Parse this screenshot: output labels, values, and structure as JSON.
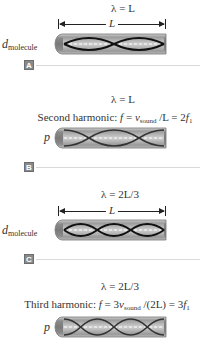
{
  "panels": [
    {
      "id": "A",
      "badge": "A",
      "wavelength": "λ = L",
      "dimension_label": "L",
      "side_label": {
        "main": "d",
        "sub": "molecule"
      },
      "wave_type": "displacement",
      "half_wavelengths": 2
    },
    {
      "id": "B",
      "badge": "B",
      "wavelength": "λ = L",
      "harmonic": {
        "name": "Second harmonic:",
        "f": "f",
        "eq1": " = ",
        "v": "v",
        "vsub": "sound",
        "rest": " /L = 2",
        "f1": "f",
        "f1sub": "1"
      },
      "side_label": {
        "main": "p",
        "sub": ""
      },
      "wave_type": "pressure",
      "half_wavelengths": 2
    },
    {
      "id": "C",
      "badge": "C",
      "wavelength": "λ = 2L/3",
      "dimension_label": "L",
      "side_label": {
        "main": "d",
        "sub": "molecule"
      },
      "wave_type": "displacement",
      "half_wavelengths": 3
    },
    {
      "id": "D",
      "wavelength": "λ = 2L/3",
      "harmonic": {
        "name": "Third harmonic:",
        "f": "f",
        "eq1": " = 3",
        "v": "v",
        "vsub": "sound",
        "rest": " /(2L) = 3",
        "f1": "f",
        "f1sub": "1"
      },
      "side_label": {
        "main": "p",
        "sub": ""
      },
      "wave_type": "pressure",
      "half_wavelengths": 3
    }
  ],
  "colors": {
    "tube_outer": "#8c8c8c",
    "tube_inner": "#c8c8c8",
    "wave_displacement": "#111111",
    "wave_pressure": "#3a3a3a",
    "axis_dash": "#ffffff",
    "badge_bg": "#8a8a8a",
    "separator": "#d9d9d9"
  }
}
